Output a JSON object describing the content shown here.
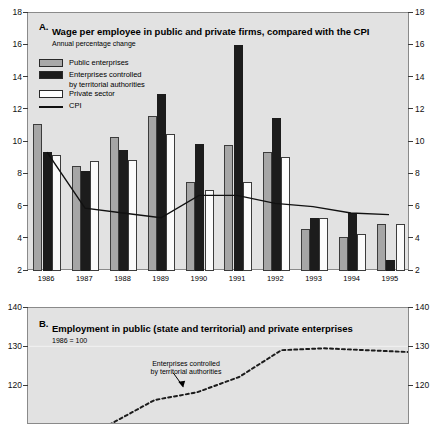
{
  "figure": {
    "background_color": "#e2e2e2",
    "colors": {
      "public": "#a6a6a6",
      "territorial": "#1c1c1c",
      "private": "#fbfbfb",
      "cpi_line": "#111111"
    }
  },
  "panelA": {
    "letter": "A.",
    "title": "Wage per employee in public and private firms, compared with the CPI",
    "subtitle": "Annual percentage change",
    "legend": [
      {
        "label": "Public enterprises",
        "swatch": "public"
      },
      {
        "label": "Enterprises controlled",
        "label2": "by territorial authorities",
        "swatch": "territorial"
      },
      {
        "label": "Private sector",
        "swatch": "private"
      },
      {
        "label": "CPI",
        "swatch": "line"
      }
    ]
  },
  "panelB": {
    "letter": "B.",
    "title": "Employment in public (state and territorial) and private enterprises",
    "subtitle": "1986 = 100",
    "annotation": "Enterprises controlled",
    "annotation2": "by territorial authorities"
  },
  "chart_data": [
    {
      "type": "bar",
      "title": "A. Wage per employee in public and private firms, compared with the CPI",
      "subtitle": "Annual percentage change",
      "xlabel": "",
      "ylabel": "",
      "ylim": [
        2,
        18
      ],
      "yticks": [
        2,
        4,
        6,
        8,
        10,
        12,
        14,
        16,
        18
      ],
      "grid": false,
      "legend_position": "top-left",
      "categories": [
        "1986",
        "1987",
        "1988",
        "1989",
        "1990",
        "1991",
        "1992",
        "1993",
        "1994",
        "1995"
      ],
      "series": [
        {
          "name": "Public enterprises",
          "type": "bar",
          "color": "#a6a6a6",
          "values": [
            11.1,
            8.5,
            10.3,
            11.6,
            7.5,
            9.8,
            9.4,
            4.6,
            4.1,
            4.9
          ]
        },
        {
          "name": "Enterprises controlled by territorial authorities",
          "type": "bar",
          "color": "#1c1c1c",
          "values": [
            9.4,
            8.2,
            9.5,
            13.0,
            9.9,
            16.0,
            11.5,
            5.3,
            5.6,
            2.7
          ]
        },
        {
          "name": "Private sector",
          "type": "bar",
          "color": "#fbfbfb",
          "values": [
            9.2,
            8.8,
            8.9,
            10.5,
            7.0,
            7.5,
            9.1,
            5.3,
            4.3,
            4.9
          ]
        },
        {
          "name": "CPI",
          "type": "line",
          "color": "#111111",
          "values": [
            9.3,
            5.8,
            5.5,
            5.2,
            6.6,
            6.6,
            6.1,
            5.9,
            5.5,
            5.4
          ]
        }
      ]
    },
    {
      "type": "line",
      "title": "B. Employment in public (state and territorial) and private enterprises",
      "subtitle": "1986 = 100",
      "xlabel": "",
      "ylabel": "",
      "ylim": [
        110,
        140
      ],
      "yticks": [
        120,
        130,
        140
      ],
      "grid": false,
      "annotations": [
        "Enterprises controlled by territorial authorities"
      ],
      "series": [
        {
          "name": "Enterprises controlled by territorial authorities",
          "style": "dotted",
          "color": "#1c1c1c",
          "x": [
            1986,
            1987,
            1988,
            1989,
            1990,
            1991,
            1992,
            1993,
            1994,
            1995
          ],
          "values": [
            100,
            104,
            110,
            116,
            118,
            122,
            129,
            129.5,
            129,
            128.5
          ]
        }
      ]
    }
  ]
}
